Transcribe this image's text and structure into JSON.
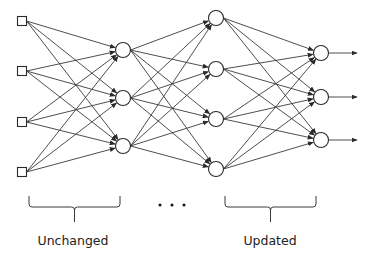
{
  "diagram": {
    "type": "feedforward-neural-network",
    "colors": {
      "stroke": "#3a3a3a",
      "node_fill": "#ffffff",
      "text": "#222222",
      "background": "#ffffff"
    },
    "layers": [
      {
        "name": "input",
        "shape": "square",
        "x": 22,
        "size": 9,
        "ys": [
          21,
          71,
          122,
          172
        ]
      },
      {
        "name": "hidden-1",
        "shape": "circle",
        "x": 123,
        "r": 7.5,
        "ys": [
          50,
          98,
          146
        ]
      },
      {
        "name": "hidden-2",
        "shape": "circle",
        "x": 216,
        "r": 7.5,
        "ys": [
          18,
          69,
          119,
          169
        ]
      },
      {
        "name": "output",
        "shape": "circle",
        "x": 321,
        "r": 7.5,
        "ys": [
          53,
          97,
          140
        ]
      }
    ],
    "output_arrow_end_x": 357,
    "ellipsis": {
      "y": 205,
      "xs": [
        160,
        172,
        184
      ]
    },
    "groups": [
      {
        "label": "Unchanged",
        "brace": {
          "x1": 29,
          "x2": 120,
          "top": 196,
          "mid": 207,
          "stem_bottom": 222
        },
        "label_x": 73,
        "label_y": 245
      },
      {
        "label": "Updated",
        "brace": {
          "x1": 225,
          "x2": 316,
          "top": 196,
          "mid": 207,
          "stem_bottom": 222
        },
        "label_x": 270,
        "label_y": 245
      }
    ]
  },
  "labels": {
    "left_group": "Unchanged",
    "right_group": "Updated",
    "ellipsis": "..."
  }
}
